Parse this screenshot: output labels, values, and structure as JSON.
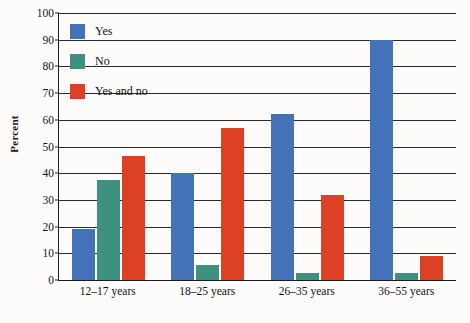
{
  "chart_data": {
    "type": "bar",
    "title": "",
    "xlabel": "",
    "ylabel": "Percent",
    "ylim": [
      0,
      100
    ],
    "ytick_step": 10,
    "yticks": [
      0,
      10,
      20,
      30,
      40,
      50,
      60,
      70,
      80,
      90,
      100
    ],
    "ytick_labels": [
      "0",
      "10",
      "20",
      "30",
      "40",
      "50",
      "60",
      "70",
      "80",
      "90",
      "100"
    ],
    "grid": true,
    "legend_position": "top-left inside plot",
    "categories": [
      "12–17 years",
      "18–25 years",
      "26–35 years",
      "36–55 years"
    ],
    "series": [
      {
        "name": "Yes",
        "color": "#4472b8",
        "values": [
          19,
          40,
          62,
          90
        ]
      },
      {
        "name": "No",
        "color": "#3f917f",
        "values": [
          37.5,
          5.5,
          2.5,
          2.5
        ]
      },
      {
        "name": "Yes and no",
        "color": "#dc4124",
        "values": [
          46.5,
          57,
          32,
          9
        ]
      }
    ]
  },
  "legend": {
    "items": [
      {
        "label": "Yes",
        "color": "#4472b8"
      },
      {
        "label": "No",
        "color": "#3f917f"
      },
      {
        "label": "Yes and no",
        "color": "#dc4124"
      }
    ]
  },
  "axes": {
    "y_title": "Percent"
  }
}
